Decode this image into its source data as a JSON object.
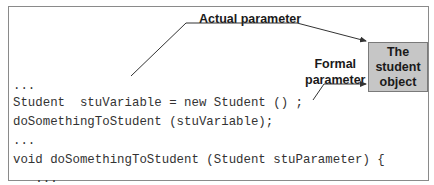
{
  "diagram": {
    "code_lines": [
      "...",
      "Student  stuVariable = new Student () ;",
      "doSomethingToStudent (stuVariable);",
      "...",
      "void doSomethingToStudent (Student stuParameter) {",
      "   ...",
      "   stuParameter.setName(\"Bill\");",
      "   ...",
      "}"
    ],
    "labels": {
      "actual_parameter": "Actual parameter",
      "formal_parameter_line1": "Formal",
      "formal_parameter_line2": "parameter"
    },
    "object_box": {
      "line1": "The",
      "line2": "student",
      "line3": "object"
    },
    "colors": {
      "object_box_fill": "#c6c6c6",
      "frame_border": "#8a8a8a",
      "arrow": "#333333"
    }
  }
}
